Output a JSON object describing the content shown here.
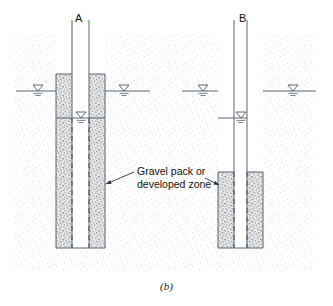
{
  "figure": {
    "caption": "(b)",
    "wells": [
      {
        "id": "A",
        "label": "A",
        "description": "Well with gravel pack extending from near ground surface to bottom of borehole",
        "gravel_pack_top_y": 74,
        "gravel_pack_bottom_y": 248,
        "casing_top_y": 74,
        "borehole_bottom_y": 248,
        "inner_water_level_y": 118
      },
      {
        "id": "B",
        "label": "B",
        "description": "Well with short gravel pack confined to lower screened interval",
        "gravel_pack_top_y": 172,
        "gravel_pack_bottom_y": 248,
        "casing_top_y": 172,
        "borehole_bottom_y": 248,
        "inner_water_level_y": 118
      }
    ],
    "annotation": {
      "line1": "Gravel pack or",
      "line2": "developed zone"
    },
    "water_table": {
      "surface_level_y": 91,
      "inner_level_y": 118,
      "symbol": "water-table-triangle"
    },
    "colors": {
      "line": "#5a6570",
      "soil_stipple": "#b9c0c6",
      "gravel_fill": "#c9ccce",
      "text": "#111111",
      "well_interior": "#ffffff"
    }
  }
}
